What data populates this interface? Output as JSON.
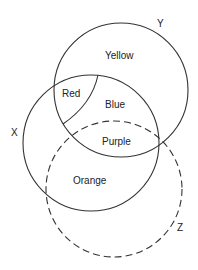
{
  "diagram": {
    "type": "venn",
    "sets": [
      {
        "name": "X",
        "style": "solid"
      },
      {
        "name": "Y",
        "style": "solid"
      },
      {
        "name": "Z",
        "style": "dashed"
      }
    ],
    "set_labels": {
      "x": "X",
      "y": "Y",
      "z": "Z"
    },
    "regions": {
      "yellow": "Yellow",
      "red": "Red",
      "blue": "Blue",
      "purple": "Purple",
      "orange": "Orange"
    },
    "colors": {
      "stroke": "#333333",
      "text": "#222222",
      "background": "#ffffff"
    }
  }
}
